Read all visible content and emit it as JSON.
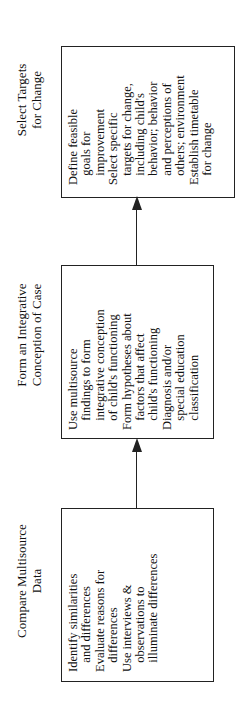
{
  "stages": [
    {
      "title": "Select Targets\nfor Change",
      "body": "Define feasible\n   goals for\n   improvement\nSelect specific\n   targets for change,\n   including child's\n   behavior; behavior\n   and perceptions of\n   others; environment\nEstablish timetable\n   for change"
    },
    {
      "title": "Form an Integrative\nConception of Case",
      "body": "Use multisource\n   findings to form\n   integrative conception\n   of child's functioning\nForm hypotheses about\n   factors that affect\n   child's functioning\nDiagnosis and/or\n   special education\n   classification"
    },
    {
      "title": "Compare Multisource\nData",
      "body": "Identify similarities\n   and differences\nEvaluate reasons for\n   differences\nUse interviews &\n   observations to\n   illuminate differences"
    }
  ]
}
